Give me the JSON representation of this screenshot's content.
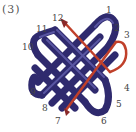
{
  "figure": {
    "label": "(3)",
    "colors": {
      "cord_main": "#2f2a6e",
      "cord_main_highlight": "#6b68b8",
      "cord_trace": "#c0402a"
    },
    "loop_numbers": [
      {
        "n": "1",
        "x": 108,
        "y": 12
      },
      {
        "n": "2",
        "x": 115,
        "y": 28
      },
      {
        "n": "3",
        "x": 125,
        "y": 36
      },
      {
        "n": "4",
        "x": 126,
        "y": 88
      },
      {
        "n": "5",
        "x": 118,
        "y": 104
      },
      {
        "n": "6",
        "x": 103,
        "y": 121
      },
      {
        "n": "7",
        "x": 56,
        "y": 122
      },
      {
        "n": "8",
        "x": 44,
        "y": 108
      },
      {
        "n": "9",
        "x": 31,
        "y": 93
      },
      {
        "n": "10",
        "x": 24,
        "y": 46
      },
      {
        "n": "11",
        "x": 36,
        "y": 30
      },
      {
        "n": "12",
        "x": 52,
        "y": 16
      }
    ]
  }
}
